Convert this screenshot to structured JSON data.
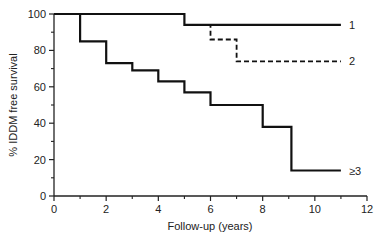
{
  "chart_data": {
    "type": "line",
    "subtype": "kaplan-meier-step",
    "title": "",
    "xlabel": "Follow-up (years)",
    "ylabel": "% IDDM free survival",
    "xlim": [
      0,
      12
    ],
    "ylim": [
      0,
      100
    ],
    "xticks": [
      0,
      2,
      4,
      6,
      8,
      10,
      12
    ],
    "xminor": [
      1,
      3,
      5,
      7,
      9,
      11
    ],
    "yticks": [
      0,
      20,
      40,
      60,
      80,
      100
    ],
    "yminor": [
      10,
      30,
      50,
      70,
      90
    ],
    "grid": false,
    "legend": "inline labels at line ends",
    "series": [
      {
        "name": "1",
        "style": "solid",
        "steps": [
          [
            0,
            100
          ],
          [
            5,
            100
          ],
          [
            5,
            94
          ],
          [
            11,
            94
          ]
        ]
      },
      {
        "name": "2",
        "style": "dashed",
        "steps": [
          [
            5,
            94
          ],
          [
            6,
            94
          ],
          [
            6,
            86
          ],
          [
            7,
            86
          ],
          [
            7,
            74
          ],
          [
            11,
            74
          ]
        ]
      },
      {
        "name": "≥3",
        "style": "solid",
        "steps": [
          [
            0,
            100
          ],
          [
            1,
            100
          ],
          [
            1,
            85
          ],
          [
            2,
            85
          ],
          [
            2,
            73
          ],
          [
            3,
            73
          ],
          [
            3,
            69
          ],
          [
            4,
            69
          ],
          [
            4,
            63
          ],
          [
            5,
            63
          ],
          [
            5,
            57
          ],
          [
            6,
            57
          ],
          [
            6,
            50
          ],
          [
            8,
            50
          ],
          [
            8,
            38
          ],
          [
            9.1,
            38
          ],
          [
            9.1,
            14
          ],
          [
            11,
            14
          ]
        ]
      }
    ]
  }
}
